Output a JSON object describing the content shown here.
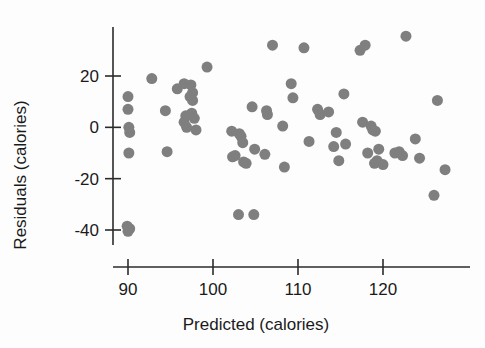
{
  "chart_data": {
    "type": "scatter",
    "title": "",
    "xlabel": "Predicted (calories)",
    "ylabel": "Residuals (calories)",
    "xlim": [
      86.5,
      129.5
    ],
    "ylim": [
      -45,
      39
    ],
    "xticks": [
      90,
      100,
      110,
      120
    ],
    "xtick_labels": [
      "90",
      "100",
      "110",
      "120"
    ],
    "yticks": [
      20,
      0,
      -20,
      -40
    ],
    "ytick_labels": [
      "20",
      "0",
      "-20",
      "-40"
    ],
    "grid": false,
    "legend": null,
    "marker": {
      "shape": "circle",
      "color": "#7f7f7f",
      "size_px": 11
    },
    "series": [
      {
        "name": "Residuals vs predicted calories",
        "points": [
          [
            90.0,
            12.0
          ],
          [
            90.0,
            7.0
          ],
          [
            90.1,
            0.0
          ],
          [
            90.2,
            -2.0
          ],
          [
            90.1,
            -10.0
          ],
          [
            89.9,
            -38.5
          ],
          [
            90.2,
            -39.5
          ],
          [
            90.0,
            -40.5
          ],
          [
            92.8,
            19.0
          ],
          [
            94.4,
            6.5
          ],
          [
            94.6,
            -9.5
          ],
          [
            95.8,
            15.0
          ],
          [
            96.6,
            17.0
          ],
          [
            96.8,
            4.5
          ],
          [
            96.6,
            2.0
          ],
          [
            96.9,
            0.0
          ],
          [
            97.4,
            16.5
          ],
          [
            97.3,
            12.0
          ],
          [
            97.6,
            13.5
          ],
          [
            97.6,
            10.5
          ],
          [
            97.5,
            5.5
          ],
          [
            97.8,
            3.5
          ],
          [
            98.0,
            -1.0
          ],
          [
            99.3,
            23.5
          ],
          [
            102.2,
            -1.5
          ],
          [
            102.3,
            -11.5
          ],
          [
            102.6,
            -11.0
          ],
          [
            103.1,
            -2.5
          ],
          [
            103.3,
            -3.5
          ],
          [
            103.0,
            -34.0
          ],
          [
            103.6,
            -13.5
          ],
          [
            103.5,
            -6.0
          ],
          [
            103.9,
            -14.0
          ],
          [
            104.8,
            -34.0
          ],
          [
            104.6,
            8.0
          ],
          [
            104.9,
            -8.5
          ],
          [
            106.1,
            -10.5
          ],
          [
            106.3,
            6.5
          ],
          [
            106.4,
            5.0
          ],
          [
            107.0,
            32.0
          ],
          [
            108.2,
            0.5
          ],
          [
            108.4,
            -15.5
          ],
          [
            109.2,
            17.0
          ],
          [
            109.4,
            11.5
          ],
          [
            110.7,
            31.0
          ],
          [
            111.3,
            -5.5
          ],
          [
            112.3,
            7.0
          ],
          [
            112.6,
            5.0
          ],
          [
            113.6,
            6.0
          ],
          [
            114.2,
            -7.5
          ],
          [
            114.5,
            -2.0
          ],
          [
            114.8,
            -13.0
          ],
          [
            115.4,
            13.0
          ],
          [
            115.6,
            -6.5
          ],
          [
            117.3,
            30.0
          ],
          [
            117.9,
            32.0
          ],
          [
            117.6,
            2.0
          ],
          [
            118.2,
            -10.0
          ],
          [
            118.6,
            0.5
          ],
          [
            118.8,
            -1.0
          ],
          [
            119.1,
            -1.5
          ],
          [
            119.0,
            -14.0
          ],
          [
            119.3,
            -13.0
          ],
          [
            119.5,
            -8.5
          ],
          [
            120.0,
            -14.5
          ],
          [
            121.4,
            -10.0
          ],
          [
            121.9,
            -9.5
          ],
          [
            122.3,
            -11.0
          ],
          [
            122.7,
            35.5
          ],
          [
            123.8,
            -4.5
          ],
          [
            124.3,
            -12.0
          ],
          [
            126.4,
            10.5
          ],
          [
            126.0,
            -26.5
          ],
          [
            127.3,
            -16.5
          ]
        ]
      }
    ]
  }
}
